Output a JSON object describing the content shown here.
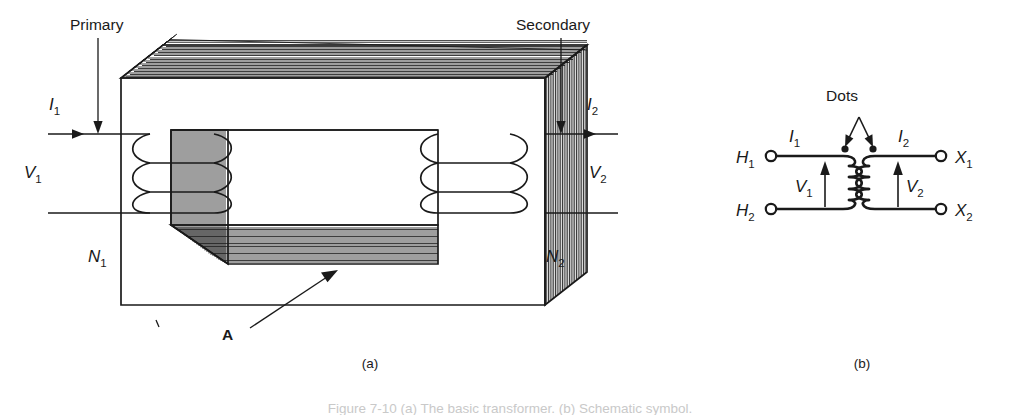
{
  "figure": {
    "panels": [
      {
        "id": "a",
        "panel_label": "(a)",
        "title_annotations": [
          {
            "name": "primary-annotation",
            "text": "Primary"
          },
          {
            "name": "secondary-annotation",
            "text": "Secondary"
          }
        ],
        "labels": {
          "current_primary": "I",
          "current_primary_sub": "1",
          "current_secondary": "I",
          "current_secondary_sub": "2",
          "voltage_primary": "V",
          "voltage_primary_sub": "1",
          "voltage_secondary": "V",
          "voltage_secondary_sub": "2",
          "turns_primary": "N",
          "turns_primary_sub": "1",
          "turns_secondary": "N",
          "turns_secondary_sub": "2",
          "area_label": "A"
        }
      },
      {
        "id": "b",
        "panel_label": "(b)",
        "dots_label": "Dots",
        "terminals": [
          {
            "name": "terminal-h1",
            "text": "H",
            "sub": "1"
          },
          {
            "name": "terminal-h2",
            "text": "H",
            "sub": "2"
          },
          {
            "name": "terminal-x1",
            "text": "X",
            "sub": "1"
          },
          {
            "name": "terminal-x2",
            "text": "X",
            "sub": "2"
          }
        ],
        "labels": {
          "current_primary": "I",
          "current_primary_sub": "1",
          "current_secondary": "I",
          "current_secondary_sub": "2",
          "voltage_primary": "V",
          "voltage_primary_sub": "1",
          "voltage_secondary": "V",
          "voltage_secondary_sub": "2"
        }
      }
    ],
    "caption": "Figure 7-10   (a) The basic transformer. (b) Schematic symbol.",
    "colors": {
      "ink": "#1a1a1a",
      "background": "#ffffff"
    }
  }
}
